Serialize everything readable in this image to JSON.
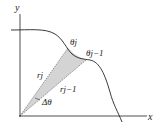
{
  "figure": {
    "axes": {
      "x_label": "x",
      "y_label": "y"
    },
    "labels": {
      "theta_j": "θj",
      "theta_j_minus_1": "θj−1",
      "r_j": "rj",
      "r_j_minus_1": "rj−1",
      "delta_theta": "Δθ"
    },
    "colors": {
      "curve": "#222222",
      "sector_fill": "#d0d0d0",
      "axes": "#222222"
    }
  }
}
